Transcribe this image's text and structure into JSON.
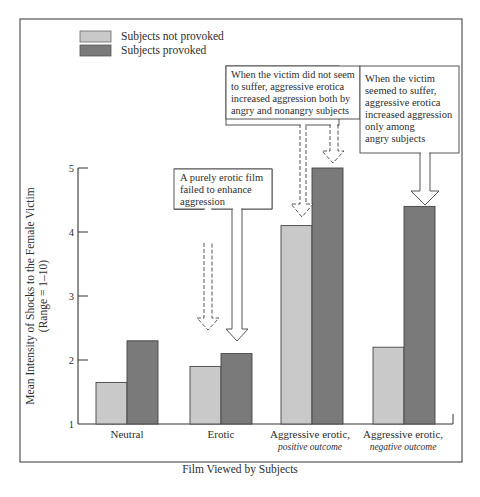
{
  "chart_data": {
    "type": "bar",
    "title": "",
    "xlabel": "Film Viewed by Subjects",
    "ylabel": "Mean Intensity of Shocks to the Female Victim",
    "ylabel_sub": "(Range = 1–10)",
    "ylim": [
      1,
      5
    ],
    "yticks": [
      1,
      2,
      3,
      4,
      5
    ],
    "grid": false,
    "legend_position": "top-left",
    "categories": [
      {
        "line1": "Neutral",
        "line2": ""
      },
      {
        "line1": "Erotic",
        "line2": ""
      },
      {
        "line1": "Aggressive erotic,",
        "line2": "positive outcome"
      },
      {
        "line1": "Aggressive erotic,",
        "line2": "negative outcome"
      }
    ],
    "series": [
      {
        "name": "Subjects not provoked",
        "color": "#c9c9c9",
        "values": [
          1.65,
          1.9,
          4.1,
          2.2
        ]
      },
      {
        "name": "Subjects provoked",
        "color": "#7a7a7a",
        "values": [
          2.3,
          2.1,
          5.0,
          4.4
        ]
      }
    ],
    "annotations": [
      {
        "lines": [
          "A purely erotic film",
          "failed to enhance",
          "aggression"
        ]
      },
      {
        "lines": [
          "When the victim did not seem",
          "to suffer, aggressive erotica",
          "increased aggression both by",
          "angry and nonangry subjects"
        ]
      },
      {
        "lines": [
          "When the victim",
          "seemed to suffer,",
          "aggressive erotica",
          "increased aggression",
          "only among",
          "angry subjects"
        ]
      }
    ]
  }
}
